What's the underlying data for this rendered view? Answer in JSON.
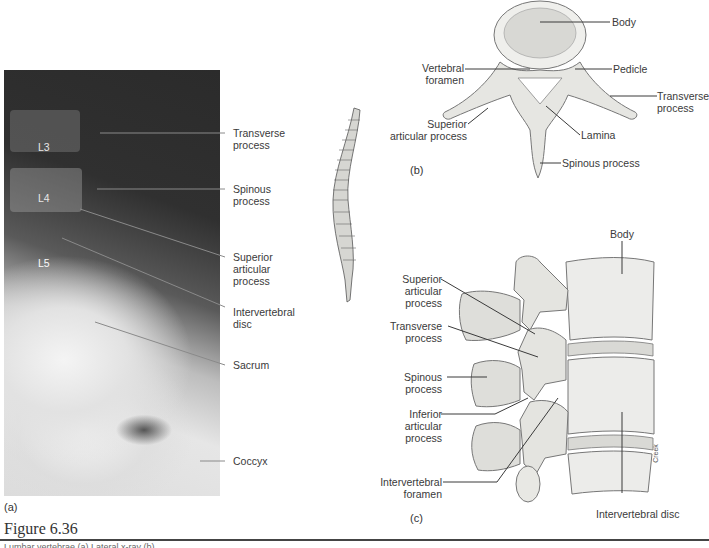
{
  "figure": {
    "title": "Figure 6.36",
    "caption_partial": "Lumbar vertebrae (a) Lateral x-ray (b)",
    "credit": "Creek"
  },
  "panel_a": {
    "letter": "(a)",
    "vertebra_tags": [
      "L3",
      "L4",
      "L5"
    ],
    "labels": [
      {
        "text_line1": "Transverse",
        "text_line2": "process"
      },
      {
        "text_line1": "Spinous",
        "text_line2": "process"
      },
      {
        "text_line1": "Superior",
        "text_line2": "articular",
        "text_line3": "process"
      },
      {
        "text_line1": "Intervertebral",
        "text_line2": "disc"
      },
      {
        "text_line1": "Sacrum"
      },
      {
        "text_line1": "Coccyx"
      }
    ]
  },
  "panel_b": {
    "letter": "(b)",
    "labels": {
      "body": "Body",
      "vertebral_foramen_1": "Vertebral",
      "vertebral_foramen_2": "foramen",
      "pedicle": "Pedicle",
      "transverse_1": "Transverse",
      "transverse_2": "process",
      "superior_1": "Superior",
      "superior_2": "articular process",
      "lamina": "Lamina",
      "spinous": "Spinous process"
    }
  },
  "panel_c": {
    "letter": "(c)",
    "labels": {
      "body": "Body",
      "superior_1": "Superior",
      "superior_2": "articular",
      "superior_3": "process",
      "transverse_1": "Transverse",
      "transverse_2": "process",
      "spinous_1": "Spinous",
      "spinous_2": "process",
      "inferior_1": "Inferior",
      "inferior_2": "articular",
      "inferior_3": "process",
      "foramen_1": "Intervertebral",
      "foramen_2": "foramen",
      "disc": "Intervertebral disc"
    }
  },
  "colors": {
    "leader_line": "#3a3a3a",
    "bone_fill": "#e9e9e6",
    "bone_shade": "#b8b8b4",
    "rule": "#444444"
  }
}
